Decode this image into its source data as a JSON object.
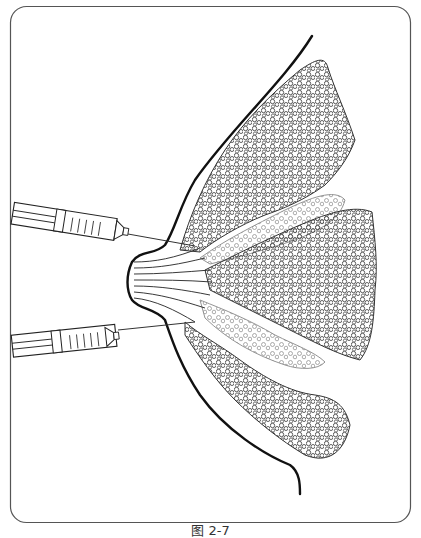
{
  "figure": {
    "caption": "图 2-7",
    "colors": {
      "stroke": "#1a1a1a",
      "lobule_stroke": "#3a3a3a",
      "light_lobule_stroke": "#8a8a8a",
      "frame": "#555555",
      "background": "#ffffff"
    },
    "elements": {
      "frame": "rounded-rectangle border",
      "breast_outline": "curved skin contour with nipple protrusion",
      "nipple": "protrusion at left with converging ducts",
      "ducts": "parallel lines radiating from nipple",
      "lobules": [
        "upper lobe",
        "upper-middle light lobe",
        "central lobe",
        "lower-middle light lobe",
        "lower lobe"
      ],
      "syringes": [
        {
          "name": "upper syringe",
          "target": "upper duct"
        },
        {
          "name": "lower syringe",
          "target": "lower duct"
        }
      ]
    }
  }
}
